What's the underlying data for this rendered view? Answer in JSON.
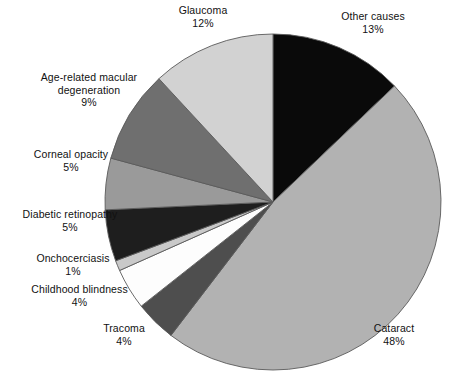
{
  "chart_data": {
    "type": "pie",
    "title": "",
    "subtitle": "",
    "xlabel": "",
    "ylabel": "",
    "legend_position": "none",
    "grid": false,
    "labels_show_percent": true,
    "start_angle_deg": 0,
    "direction": "clockwise",
    "categories": [
      "Other causes",
      "Cataract",
      "Trachoma",
      "Childhood blindness",
      "Onchocerciasis",
      "Diabetic retinopathy",
      "Corneal opacity",
      "Age-related macular degeneration",
      "Glaucoma"
    ],
    "values": [
      13,
      48,
      4,
      4,
      1,
      5,
      5,
      9,
      12
    ],
    "units": "%",
    "total": 101,
    "slices": [
      {
        "key": "other-causes",
        "name": "Other causes",
        "name_lines": [
          "Other causes"
        ],
        "value": 13,
        "value_label": "13%",
        "color": "#0a0a0a"
      },
      {
        "key": "cataract",
        "name": "Cataract",
        "name_lines": [
          "Cataract"
        ],
        "value": 48,
        "value_label": "48%",
        "color": "#b2b2b2"
      },
      {
        "key": "trachoma",
        "name": "Tracoma",
        "name_lines": [
          "Tracoma"
        ],
        "value": 4,
        "value_label": "4%",
        "color": "#4e4e4e"
      },
      {
        "key": "childhood-blindness",
        "name": "Childhood blindness",
        "name_lines": [
          "Childhood blindness"
        ],
        "value": 4,
        "value_label": "4%",
        "color": "#fdfdfd"
      },
      {
        "key": "onchocerciasis",
        "name": "Onchocerciasis",
        "name_lines": [
          "Onchocerciasis"
        ],
        "value": 1,
        "value_label": "1%",
        "color": "#c9c9c9"
      },
      {
        "key": "diabetic-retinopathy",
        "name": "Diabetic retinopathy",
        "name_lines": [
          "Diabetic retinopathy"
        ],
        "value": 5,
        "value_label": "5%",
        "color": "#1e1e1e"
      },
      {
        "key": "corneal-opacity",
        "name": "Corneal opacity",
        "name_lines": [
          "Corneal opacity"
        ],
        "value": 5,
        "value_label": "5%",
        "color": "#9a9a9a"
      },
      {
        "key": "amd",
        "name": "Age-related macular degeneration",
        "name_lines": [
          "Age-related macular",
          "degeneration"
        ],
        "value": 9,
        "value_label": "9%",
        "color": "#6f6f6f"
      },
      {
        "key": "glaucoma",
        "name": "Glaucoma",
        "name_lines": [
          "Glaucoma"
        ],
        "value": 12,
        "value_label": "12%",
        "color": "#d2d2d2"
      }
    ]
  },
  "labels": {
    "glaucoma": {
      "line1": "Glaucoma",
      "value": "12%"
    },
    "other_causes": {
      "line1": "Other causes",
      "value": "13%"
    },
    "amd": {
      "line1": "Age-related macular",
      "line2": "degeneration",
      "value": "9%"
    },
    "corneal_opacity": {
      "line1": "Corneal opacity",
      "value": "5%"
    },
    "diabetic_retinopathy": {
      "line1": "Diabetic retinopathy",
      "value": "5%"
    },
    "onchocerciasis": {
      "line1": "Onchocerciasis",
      "value": "1%"
    },
    "childhood_blindness": {
      "line1": "Childhood blindness",
      "value": "4%"
    },
    "trachoma": {
      "line1": "Tracoma",
      "value": "4%"
    },
    "cataract": {
      "line1": "Cataract",
      "value": "48%"
    }
  },
  "geometry": {
    "center_x": 273,
    "center_y": 202,
    "radius": 168
  },
  "colors": {
    "background": "#ffffff",
    "outline": "#5a5a5a",
    "text": "#111111"
  }
}
